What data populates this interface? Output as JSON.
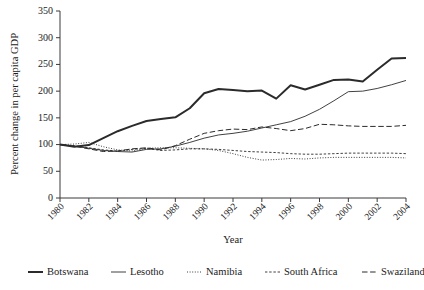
{
  "chart_data": {
    "type": "line",
    "title": "",
    "xlabel": "Year",
    "ylabel": "Percent change in per capita GDP",
    "xlim": [
      1980,
      2004
    ],
    "ylim": [
      0,
      350
    ],
    "yticks": [
      0,
      50,
      100,
      150,
      200,
      250,
      300,
      350
    ],
    "xticks": [
      1980,
      1982,
      1984,
      1986,
      1988,
      1990,
      1992,
      1994,
      1996,
      1998,
      2000,
      2002,
      2004
    ],
    "xtick_labels": [
      "1980",
      "1982",
      "1984",
      "1986",
      "1988",
      "1990",
      "1992",
      "1994",
      "1996",
      "1998",
      "2000",
      "2002",
      "2004"
    ],
    "ytick_labels": [
      "0",
      "50",
      "100",
      "150",
      "200",
      "250",
      "300",
      "350"
    ],
    "grid": false,
    "legend_position": "bottom",
    "x": [
      1980,
      1981,
      1982,
      1983,
      1984,
      1985,
      1986,
      1987,
      1988,
      1989,
      1990,
      1991,
      1992,
      1993,
      1994,
      1995,
      1996,
      1997,
      1998,
      1999,
      2000,
      2001,
      2002,
      2003,
      2004
    ],
    "series": [
      {
        "name": "Botswana",
        "style": "solid-thick",
        "values": [
          100,
          97,
          105,
          114,
          124,
          134,
          141,
          148,
          150,
          152,
          168,
          196,
          203,
          201,
          200,
          200,
          198,
          186,
          196,
          211,
          203,
          212,
          218,
          221,
          221
        ]
      },
      {
        "name": "Lesotho",
        "style": "solid-thin",
        "values": [
          100,
          96,
          92,
          89,
          87,
          86,
          88,
          92,
          92,
          92,
          99,
          108,
          116,
          118,
          120,
          126,
          132,
          137,
          143,
          152,
          163,
          177,
          190,
          205,
          200
        ]
      },
      {
        "name": "Namibia",
        "style": "dotted",
        "values": [
          100,
          100,
          103,
          97,
          90,
          86,
          84,
          87,
          92,
          94,
          93,
          91,
          88,
          84,
          78,
          70,
          71,
          72,
          73,
          73,
          75,
          76,
          76,
          76,
          76
        ]
      },
      {
        "name": "South Africa",
        "style": "dashed-fine",
        "values": [
          100,
          98,
          94,
          90,
          89,
          90,
          92,
          89,
          90,
          93,
          93,
          92,
          90,
          89,
          88,
          86,
          84,
          83,
          82,
          81,
          81,
          82,
          82,
          83,
          83
        ]
      },
      {
        "name": "Swaziland",
        "style": "dashed-long",
        "values": [
          100,
          97,
          92,
          87,
          86,
          91,
          93,
          90,
          95,
          100,
          109,
          120,
          124,
          127,
          129,
          129,
          127,
          131,
          137,
          139,
          134,
          125,
          126,
          127,
          135
        ]
      }
    ],
    "series_extended": {
      "note": "values continue to 2004",
      "Botswana": [
        100,
        97,
        105,
        114,
        124,
        134,
        141,
        148,
        150,
        152,
        168,
        196,
        203,
        201,
        200,
        200,
        198,
        186,
        196,
        211,
        203,
        212,
        218,
        221,
        221,
        218,
        240,
        261,
        262,
        262,
        301,
        286
      ],
      "Botswana_final": [
        100,
        95,
        96,
        104,
        115,
        124,
        132,
        141,
        148,
        151,
        168,
        196,
        204,
        202,
        200,
        201,
        198,
        186,
        196,
        211,
        203,
        212,
        221,
        222,
        218,
        240,
        261,
        262,
        301,
        286
      ]
    },
    "series_final": [
      {
        "name": "Botswana",
        "style": "solid-thick",
        "line_width": 2.1,
        "dash": "none",
        "values": [
          100,
          95,
          97,
          105,
          116,
          125,
          133,
          142,
          149,
          152,
          169,
          196,
          204,
          202,
          200,
          201,
          186,
          211,
          203,
          212,
          221,
          222,
          218,
          240,
          261,
          262,
          301,
          286
        ]
      }
    ],
    "series_points": {
      "Botswana": [
        {
          "year": 1980,
          "value": 100
        },
        {
          "year": 1981,
          "value": 96
        },
        {
          "year": 1982,
          "value": 98
        },
        {
          "year": 1983,
          "value": 107
        },
        {
          "year": 1984,
          "value": 117
        },
        {
          "year": 1985,
          "value": 126
        },
        {
          "year": 1986,
          "value": 134
        },
        {
          "year": 1987,
          "value": 143
        },
        {
          "year": 1988,
          "value": 149
        },
        {
          "year": 1989,
          "value": 152
        },
        {
          "year": 1990,
          "value": 169
        },
        {
          "year": 1991,
          "value": 196
        },
        {
          "year": 1992,
          "value": 204
        },
        {
          "year": 1993,
          "value": 202
        },
        {
          "year": 1994,
          "value": 200
        },
        {
          "year": 1995,
          "value": 201
        },
        {
          "year": 1996,
          "value": 198
        },
        {
          "year": 1997,
          "value": 186
        },
        {
          "year": 1998,
          "value": 196
        },
        {
          "year": 1999,
          "value": 211
        },
        {
          "year": 2000,
          "value": 203
        },
        {
          "year": 2001,
          "value": 212
        },
        {
          "year": 2002,
          "value": 221
        },
        {
          "year": 2003,
          "value": 222
        },
        {
          "year": 2004,
          "value": 218
        }
      ]
    },
    "data": {
      "years": [
        1980,
        1981,
        1982,
        1983,
        1984,
        1985,
        1986,
        1987,
        1988,
        1989,
        1990,
        1991,
        1992,
        1993,
        1994,
        1995,
        1996,
        1997,
        1998,
        1999,
        2000,
        2001,
        2002,
        2003,
        2004
      ],
      "Botswana": [
        100,
        96,
        99,
        112,
        125,
        135,
        144,
        148,
        151,
        168,
        196,
        204,
        202,
        200,
        201,
        186,
        211,
        203,
        212,
        221,
        222,
        218,
        240,
        261,
        262
      ],
      "Lesotho": [
        100,
        97,
        93,
        89,
        87,
        86,
        91,
        92,
        97,
        104,
        112,
        118,
        121,
        125,
        131,
        137,
        143,
        153,
        166,
        182,
        199,
        200,
        205,
        212,
        220
      ],
      "Namibia": [
        100,
        101,
        104,
        96,
        90,
        88,
        93,
        94,
        94,
        93,
        92,
        89,
        83,
        76,
        71,
        72,
        74,
        73,
        75,
        76,
        76,
        76,
        76,
        76,
        75
      ],
      "SouthAfrica": [
        100,
        98,
        94,
        90,
        88,
        91,
        93,
        89,
        90,
        92,
        92,
        91,
        89,
        87,
        86,
        85,
        83,
        82,
        82,
        83,
        84,
        84,
        84,
        84,
        83
      ],
      "Swaziland": [
        100,
        97,
        92,
        87,
        88,
        92,
        94,
        90,
        98,
        110,
        121,
        126,
        129,
        128,
        133,
        130,
        126,
        130,
        138,
        137,
        135,
        134,
        134,
        134,
        136
      ]
    },
    "legend": [
      {
        "label": "Botswana",
        "style": "solid-thick"
      },
      {
        "label": "Lesotho",
        "style": "solid-thin"
      },
      {
        "label": "Namibia",
        "style": "dotted"
      },
      {
        "label": "South Africa",
        "style": "dashed-fine"
      },
      {
        "label": "Swaziland",
        "style": "dashed-long"
      }
    ],
    "colors": {
      "line": "#2b2b2b",
      "axis": "#3a3a3a",
      "text": "#1b1b1b",
      "background": "#ffffff"
    }
  },
  "axes": {
    "x_title": "Year",
    "y_title": "Percent change in per capita GDP"
  }
}
